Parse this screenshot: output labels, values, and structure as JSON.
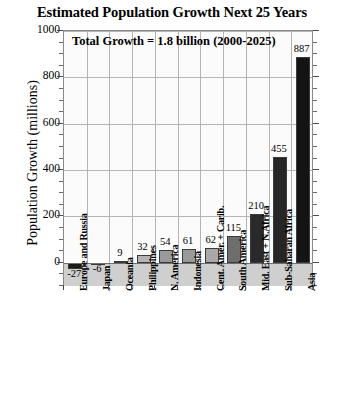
{
  "chart_data": {
    "type": "bar",
    "title": "Estimated Population Growth Next 25 Years",
    "xlabel": "",
    "ylabel": "Population Growth (millions)",
    "ylim": [
      -100,
      1000
    ],
    "yticks": [
      0,
      200,
      400,
      600,
      800,
      1000
    ],
    "ytick_labels": [
      "0",
      "200",
      "400",
      "600",
      "800",
      "1000"
    ],
    "grid": true,
    "legend": "none",
    "annotation": "Total Growth = 1.8 billion (2000-2025)",
    "categories": [
      "Europe and Russia",
      "Japan",
      "Oceania",
      "Philippines",
      "N. America",
      "Indonesia",
      "Cent. Amer. + Carib.",
      "South America",
      "Mid. East + N.Africa",
      "Sub-Saharan Africa",
      "Asia"
    ],
    "values": [
      -27,
      -6,
      9,
      32,
      54,
      61,
      62,
      115,
      210,
      455,
      887
    ],
    "value_labels": [
      "-27",
      "-6",
      "9",
      "32",
      "54",
      "61",
      "62",
      "115",
      "210",
      "455",
      "887"
    ],
    "bar_colors": [
      "#1c1c1c",
      "#b9b9b9",
      "#c2c2c2",
      "#b4b4b4",
      "#9a9a9a",
      "#9a9a9a",
      "#a8a8a8",
      "#6e6e6e",
      "#2a2a2a",
      "#262626",
      "#141414"
    ]
  },
  "colors": {
    "background": "#ffffff",
    "plot_background": "#fbfbfb",
    "grid": "#b4b4b4",
    "axis": "#8a8a8a",
    "text": "#000000",
    "below_zero_band": "#cfcfcf"
  }
}
